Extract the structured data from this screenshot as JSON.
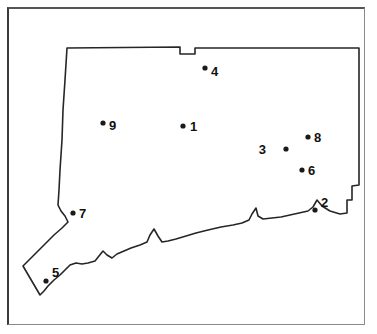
{
  "figure": {
    "map_region": "Connecticut",
    "frame": {
      "border_color": "#3a3a3a",
      "background": "#ffffff"
    },
    "outline_color": "#262626",
    "marker_color": "#1a1a1a"
  },
  "sites": [
    {
      "id": "1",
      "label": "1",
      "dot_x": 183,
      "dot_y": 126,
      "label_x": 190,
      "label_y": 131,
      "label_side": "right"
    },
    {
      "id": "2",
      "label": "2",
      "dot_x": 315,
      "dot_y": 210,
      "label_x": 321,
      "label_y": 207,
      "label_side": "right"
    },
    {
      "id": "3",
      "label": "3",
      "dot_x": 286,
      "dot_y": 149,
      "label_x": 266,
      "label_y": 154,
      "label_side": "left"
    },
    {
      "id": "4",
      "label": "4",
      "dot_x": 205,
      "dot_y": 68,
      "label_x": 211,
      "label_y": 76,
      "label_side": "right"
    },
    {
      "id": "5",
      "label": "5",
      "dot_x": 46,
      "dot_y": 281,
      "label_x": 52,
      "label_y": 277,
      "label_side": "right"
    },
    {
      "id": "6",
      "label": "6",
      "dot_x": 302,
      "dot_y": 170,
      "label_x": 308,
      "label_y": 175,
      "label_side": "right"
    },
    {
      "id": "7",
      "label": "7",
      "dot_x": 73,
      "dot_y": 213,
      "label_x": 79,
      "label_y": 218,
      "label_side": "right"
    },
    {
      "id": "8",
      "label": "8",
      "dot_x": 308,
      "dot_y": 137,
      "label_x": 314,
      "label_y": 142,
      "label_side": "right"
    },
    {
      "id": "9",
      "label": "9",
      "dot_x": 103,
      "dot_y": 123,
      "label_x": 109,
      "label_y": 130,
      "label_side": "right"
    }
  ],
  "outline": {
    "path": "M 67,48 L 180,47 L 180,54 L 195,54 L 195,48 L 359,48 L 359,185 L 352,186 L 352,200 L 347,200 L 347,213 L 340,214 L 330,211 L 322,206 L 317,200 L 313,207 L 308,211 L 299,213 L 290,215 L 281,217 L 272,218 L 263,219 L 258,216 L 256,208 L 252,214 L 249,220 L 242,223 L 233,225 L 221,227 L 208,230 L 196,233 L 186,236 L 176,239 L 168,241 L 162,242 L 158,236 L 154,229 L 150,235 L 147,242 L 140,245 L 131,248 L 124,251 L 117,254 L 112,258 L 107,255 L 103,251 L 99,256 L 95,261 L 88,263 L 82,264 L 76,263 L 70,265 L 65,270 L 60,275 L 54,280 L 48,286 L 44,291 L 40,295 L 23,266 L 30,259 L 38,251 L 46,243 L 54,235 L 62,228 L 68,222 L 65,216 L 61,211 L 58,205 L 59,190 L 60,170 L 62,140 L 63,110 L 65,80 L 67,48 Z"
  }
}
